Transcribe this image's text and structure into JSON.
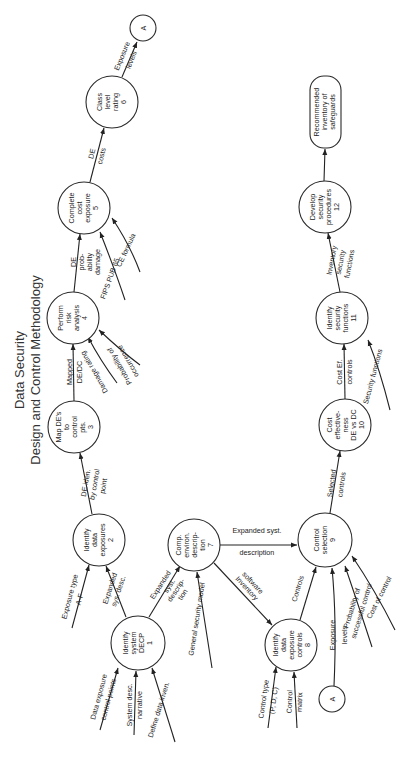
{
  "title": {
    "line1": "Data Security",
    "line2": "Design and Control Methodology"
  },
  "nodes": {
    "n1": {
      "lines": [
        "Identify",
        "system",
        "DECP",
        "1"
      ]
    },
    "n2": {
      "lines": [
        "Identify",
        "data",
        "exposures",
        "2"
      ]
    },
    "n3": {
      "lines": [
        "Map DE's",
        "to",
        "control",
        "pts.",
        "3"
      ]
    },
    "n4": {
      "lines": [
        "Perform",
        "risk",
        "analysis",
        "4"
      ]
    },
    "n5": {
      "lines": [
        "Complete",
        "cost",
        "exposure",
        "5"
      ]
    },
    "n6": {
      "lines": [
        "Class",
        "level",
        "rating",
        "6"
      ]
    },
    "n7": {
      "lines": [
        "Comp.",
        "environ.",
        "descrip-",
        "tion",
        "7"
      ]
    },
    "n8": {
      "lines": [
        "Identify",
        "data",
        "exposure",
        "controls",
        "8"
      ]
    },
    "n9": {
      "lines": [
        "Control",
        "selection",
        "9"
      ]
    },
    "n10": {
      "lines": [
        "Cost",
        "effective-",
        "ness",
        "DE vs DC",
        "10"
      ]
    },
    "n11": {
      "lines": [
        "Identify",
        "security",
        "functions",
        "11"
      ]
    },
    "n12": {
      "lines": [
        "Develop",
        "security",
        "procedures",
        "12"
      ]
    },
    "connector_top": {
      "label": "A"
    },
    "connector_bottom": {
      "label": "A"
    },
    "output": {
      "lines": [
        "Recommended",
        "inventory of",
        "safeguards"
      ]
    }
  },
  "edges": {
    "e1_2": [
      "Expanded",
      "sys. desc."
    ],
    "e1_7": [
      "Expanded",
      "syst.",
      "descrip-",
      "tion"
    ],
    "e2_3": [
      "DE iden.",
      "by control",
      "point"
    ],
    "e3_4": [
      "Mapped",
      "DE/DC"
    ],
    "e4_5": [
      "DE",
      "prob-",
      "ability",
      "damage"
    ],
    "e5_6": [
      "DE",
      "costs"
    ],
    "e6_A": [
      "Exposure",
      "levels"
    ],
    "e7_9": [
      "Expanded syst.",
      "description"
    ],
    "e7_8": [
      "Inventory",
      "software"
    ],
    "e8_9": [
      "Controls"
    ],
    "eA_9": [
      "Exposure",
      "levels"
    ],
    "e9_10": [
      "Selected",
      "controls"
    ],
    "e10_11": [
      "Cost Ef.",
      "controls"
    ],
    "e11_12": [
      "Inventory",
      "security",
      "functions"
    ]
  },
  "inputs": {
    "in1_a": [
      "Data exposure",
      "control points"
    ],
    "in1_b": [
      "System desc.",
      "narrative"
    ],
    "in1_c": [
      "Define data inven."
    ],
    "in2_a": [
      "Exposure type",
      "A-F"
    ],
    "in4_a": [
      "Damage rating"
    ],
    "in4_b": [
      "Probability of",
      "occurrence"
    ],
    "in5_a": [
      "FIPS PUB 65"
    ],
    "in5_b": [
      "CE formula"
    ],
    "in7_a": [
      "General security model"
    ],
    "in8_a": [
      "Control type",
      "(P, D, C)"
    ],
    "in8_b": [
      "Control",
      "matrix"
    ],
    "in9_a": [
      "Probability of",
      "successful control"
    ],
    "in9_b": [
      "Cost of control"
    ],
    "in11_a": [
      "Security functions"
    ]
  }
}
